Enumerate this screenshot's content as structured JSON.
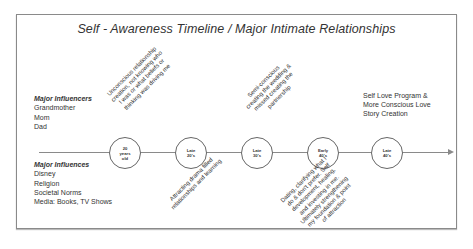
{
  "title": "Self - Awareness Timeline / Major Intimate Relationships",
  "influencers": {
    "header": "Major Influencers",
    "items": [
      "Grandmother",
      "Mom",
      "Dad"
    ]
  },
  "influences": {
    "header": "Major Influences",
    "items": [
      "Disney",
      "Religion",
      "Societal Norms",
      "Media: Books, TV Shows"
    ]
  },
  "nodes": [
    {
      "label": "20\nyears\nold"
    },
    {
      "label": "Late\n20's"
    },
    {
      "label": "Late\n30's"
    },
    {
      "label": "Early\n40's"
    },
    {
      "label": "Late\n40's"
    }
  ],
  "annotations": {
    "above_20": "Unconscious relationship\ncreation, not knowing who\nI was or what beliefs or\nthinking was driving me",
    "below_late20": "Attracting drama filled\nrelationships and learning",
    "above_late30": "Semi-conscious\ncreating the wedding &\nmissed creating the\npartnership",
    "below_early40": "Dating, clarifying what I\ndo & don't prefer. Self\ndevelopment, healing,\nand investing in me.\nUltimately strengthening\nmy foundation & point\nof attraction",
    "above_late40": "Self Love Program &\nMore Conscious Love\nStory Creation"
  },
  "colors": {
    "line": "#8a8a8a",
    "text": "#333333",
    "frame": "#8a8a8a"
  }
}
